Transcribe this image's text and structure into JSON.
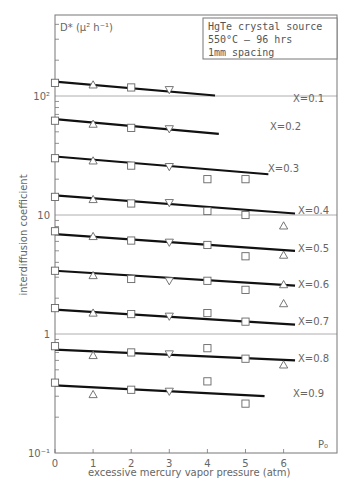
{
  "chart_data": {
    "type": "scatter",
    "title": "",
    "xlabel": "excessive mercury vapor pressure (atm)",
    "ylabel": "interdiffusion coefficient",
    "y_unit_label": "D* (μ² h⁻¹)",
    "x_corner_label": "P₀",
    "yscale": "log",
    "xlim": [
      0,
      7.2
    ],
    "ylim": [
      0.1,
      440
    ],
    "grid": "horizontal lines at decades",
    "x_ticks": [
      "0",
      "1",
      "2",
      "3",
      "4",
      "5",
      "6"
    ],
    "y_ticks": [
      {
        "value": 0.1,
        "label": "10⁻¹"
      },
      {
        "value": 1,
        "label": "1"
      },
      {
        "value": 10,
        "label": "10"
      },
      {
        "value": 100,
        "label": "10²"
      }
    ],
    "legend_box": [
      "HgTe crystal source",
      "550°C – 96 hrs",
      "1mm spacing"
    ],
    "marker_legend": {
      "square": "series measurement",
      "triangle-up": "measurement",
      "triangle-down": "measurement"
    },
    "series": [
      {
        "name": "X=0.1",
        "fit": {
          "x": [
            0,
            4.2
          ],
          "y": [
            132,
            101
          ]
        },
        "points": [
          {
            "x": 0,
            "y": 129,
            "m": "square"
          },
          {
            "x": 1,
            "y": 124,
            "m": "tri-up"
          },
          {
            "x": 2,
            "y": 118,
            "m": "square"
          },
          {
            "x": 3,
            "y": 113,
            "m": "tri-down"
          }
        ]
      },
      {
        "name": "X=0.2",
        "fit": {
          "x": [
            0,
            4.3
          ],
          "y": [
            64,
            48
          ]
        },
        "points": [
          {
            "x": 0,
            "y": 62,
            "m": "square"
          },
          {
            "x": 1,
            "y": 58,
            "m": "tri-up"
          },
          {
            "x": 2,
            "y": 54,
            "m": "square"
          },
          {
            "x": 3,
            "y": 53,
            "m": "tri-down"
          }
        ]
      },
      {
        "name": "X=0.3",
        "fit": {
          "x": [
            0,
            5.6
          ],
          "y": [
            31,
            22
          ]
        },
        "points": [
          {
            "x": 0,
            "y": 30,
            "m": "square"
          },
          {
            "x": 1,
            "y": 28.5,
            "m": "tri-up"
          },
          {
            "x": 2,
            "y": 26,
            "m": "square"
          },
          {
            "x": 3,
            "y": 25.5,
            "m": "tri-down"
          },
          {
            "x": 4,
            "y": 20,
            "m": "square"
          },
          {
            "x": 5,
            "y": 20,
            "m": "square"
          }
        ]
      },
      {
        "name": "X=0.4",
        "fit": {
          "x": [
            0,
            6.3
          ],
          "y": [
            14.6,
            10.3
          ]
        },
        "points": [
          {
            "x": 0,
            "y": 14.2,
            "m": "square"
          },
          {
            "x": 1,
            "y": 13.5,
            "m": "tri-up"
          },
          {
            "x": 2,
            "y": 12.5,
            "m": "square"
          },
          {
            "x": 3,
            "y": 12.7,
            "m": "tri-down"
          },
          {
            "x": 4,
            "y": 10.8,
            "m": "square"
          },
          {
            "x": 5,
            "y": 10,
            "m": "square"
          },
          {
            "x": 6,
            "y": 8.1,
            "m": "tri-up"
          }
        ]
      },
      {
        "name": "X=0.5",
        "fit": {
          "x": [
            0,
            6.3
          ],
          "y": [
            6.9,
            5.0
          ]
        },
        "points": [
          {
            "x": 0,
            "y": 7.3,
            "m": "square"
          },
          {
            "x": 1,
            "y": 6.6,
            "m": "tri-up"
          },
          {
            "x": 2,
            "y": 6.1,
            "m": "square"
          },
          {
            "x": 3,
            "y": 5.9,
            "m": "tri-down"
          },
          {
            "x": 4,
            "y": 5.6,
            "m": "square"
          },
          {
            "x": 5,
            "y": 4.5,
            "m": "square"
          },
          {
            "x": 6,
            "y": 4.6,
            "m": "tri-up"
          }
        ]
      },
      {
        "name": "X=0.6",
        "fit": {
          "x": [
            0,
            6.3
          ],
          "y": [
            3.4,
            2.55
          ]
        },
        "points": [
          {
            "x": 0,
            "y": 3.4,
            "m": "square"
          },
          {
            "x": 1,
            "y": 3.1,
            "m": "tri-up"
          },
          {
            "x": 2,
            "y": 2.9,
            "m": "square"
          },
          {
            "x": 3,
            "y": 2.8,
            "m": "tri-down"
          },
          {
            "x": 4,
            "y": 2.8,
            "m": "square"
          },
          {
            "x": 5,
            "y": 2.35,
            "m": "square"
          },
          {
            "x": 6,
            "y": 2.6,
            "m": "tri-up"
          }
        ]
      },
      {
        "name": "X=0.7",
        "fit": {
          "x": [
            0,
            6.3
          ],
          "y": [
            1.6,
            1.2
          ]
        },
        "points": [
          {
            "x": 0,
            "y": 1.65,
            "m": "square"
          },
          {
            "x": 1,
            "y": 1.5,
            "m": "tri-up"
          },
          {
            "x": 2,
            "y": 1.47,
            "m": "square"
          },
          {
            "x": 3,
            "y": 1.41,
            "m": "tri-down"
          },
          {
            "x": 4,
            "y": 1.5,
            "m": "square"
          },
          {
            "x": 5,
            "y": 1.27,
            "m": "square"
          },
          {
            "x": 6,
            "y": 1.8,
            "m": "tri-up"
          }
        ]
      },
      {
        "name": "X=0.8",
        "fit": {
          "x": [
            0,
            6.3
          ],
          "y": [
            0.74,
            0.6
          ]
        },
        "points": [
          {
            "x": 0,
            "y": 0.79,
            "m": "square"
          },
          {
            "x": 1,
            "y": 0.66,
            "m": "tri-up"
          },
          {
            "x": 2,
            "y": 0.7,
            "m": "square"
          },
          {
            "x": 3,
            "y": 0.68,
            "m": "tri-down"
          },
          {
            "x": 4,
            "y": 0.76,
            "m": "square"
          },
          {
            "x": 5,
            "y": 0.62,
            "m": "square"
          },
          {
            "x": 6,
            "y": 0.55,
            "m": "tri-up"
          }
        ]
      },
      {
        "name": "X=0.9",
        "fit": {
          "x": [
            0,
            5.5
          ],
          "y": [
            0.37,
            0.3
          ]
        },
        "points": [
          {
            "x": 0,
            "y": 0.39,
            "m": "square"
          },
          {
            "x": 1,
            "y": 0.31,
            "m": "tri-up"
          },
          {
            "x": 2,
            "y": 0.34,
            "m": "square"
          },
          {
            "x": 3,
            "y": 0.33,
            "m": "tri-down"
          },
          {
            "x": 4,
            "y": 0.4,
            "m": "square"
          },
          {
            "x": 5,
            "y": 0.26,
            "m": "square"
          }
        ]
      }
    ],
    "series_label_positions": [
      {
        "name": "X=0.1",
        "y": 102,
        "x": 293
      },
      {
        "name": "X=0.2",
        "y": 130,
        "x": 270
      },
      {
        "name": "X=0.3",
        "y": 172,
        "x": 268
      },
      {
        "name": "X=0.4",
        "y": 214,
        "x": 298
      },
      {
        "name": "X=0.5",
        "y": 252,
        "x": 298
      },
      {
        "name": "X=0.6",
        "y": 288,
        "x": 298
      },
      {
        "name": "X=0.7",
        "y": 325,
        "x": 298
      },
      {
        "name": "X=0.8",
        "y": 362,
        "x": 298
      },
      {
        "name": "X=0.9",
        "y": 397,
        "x": 293
      }
    ]
  }
}
